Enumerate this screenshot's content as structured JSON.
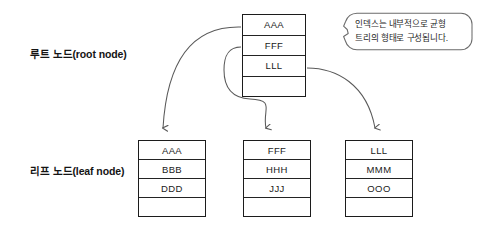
{
  "diagram": {
    "background_color": "#ffffff",
    "line_color": "#5a5a5a",
    "border_color": "#1c1c1c"
  },
  "labels": {
    "root": "루트 노드(root node)",
    "leaf": "리프 노드(leaf node)"
  },
  "callout": {
    "line1": "인덱스는 내부적으로 균형",
    "line2": "트리의 형태로 구성됩니다.",
    "text": "인덱스는 내부적으로 균형 트리의 형태로 구성됩니다."
  },
  "root_node": {
    "name": "root-node",
    "cells": [
      "AAA",
      "FFF",
      "LLL",
      ""
    ]
  },
  "leaf_nodes": [
    {
      "name": "leaf-node-1",
      "cells": [
        "AAA",
        "BBB",
        "DDD",
        ""
      ]
    },
    {
      "name": "leaf-node-2",
      "cells": [
        "FFF",
        "HHH",
        "JJJ",
        ""
      ]
    },
    {
      "name": "leaf-node-3",
      "cells": [
        "LLL",
        "MMM",
        "OOO",
        ""
      ]
    }
  ],
  "connectors": [
    {
      "name": "connector-root-to-leaf-1",
      "from": "root-node-cell-AAA",
      "to": "leaf-node-1"
    },
    {
      "name": "connector-root-to-leaf-2",
      "from": "root-node-cell-FFF",
      "to": "leaf-node-2"
    },
    {
      "name": "connector-root-to-leaf-3",
      "from": "root-node-cell-LLL",
      "to": "leaf-node-3"
    }
  ]
}
